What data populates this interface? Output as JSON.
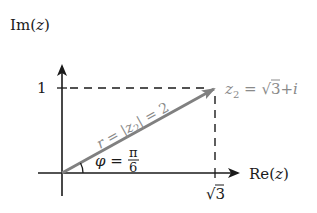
{
  "diagram": {
    "axes": {
      "x_label": {
        "prefix": "Re(",
        "var": "z",
        "suffix": ")"
      },
      "y_label": {
        "prefix": "Im(",
        "var": "z",
        "suffix": ")"
      }
    },
    "ticks": {
      "y_tick": "1",
      "x_tick": {
        "radical": "√",
        "radicand": "3"
      }
    },
    "point": {
      "name": "z",
      "subscript": "2",
      "equals": " = ",
      "real_radical": "√",
      "real_radicand": "3",
      "plus": "+",
      "imag": "i"
    },
    "modulus": {
      "r": "r",
      "eq1": " = |",
      "z": "z",
      "sub": "2",
      "eq2": "| = 2"
    },
    "angle": {
      "symbol": "φ",
      "eq": " = ",
      "numerator": "π",
      "denominator": "6"
    },
    "colors": {
      "axis": "#1a1a1a",
      "vector": "#808080",
      "label_gray": "#8a8a8a",
      "dashed": "#1a1a1a"
    }
  }
}
